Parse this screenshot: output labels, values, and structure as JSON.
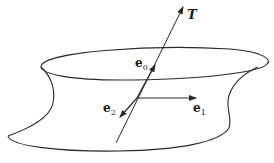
{
  "figure": {
    "colors": {
      "stroke": "#2a2a2a",
      "background": "#ffffff"
    },
    "labels": {
      "T": "T",
      "e0": {
        "base": "e",
        "sub": "0"
      },
      "e1": {
        "base": "e",
        "sub": "1"
      },
      "e2": {
        "base": "e",
        "sub": "2"
      }
    }
  }
}
